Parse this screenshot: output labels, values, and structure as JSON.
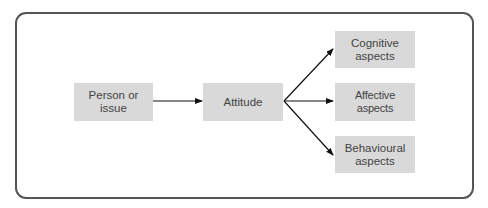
{
  "diagram": {
    "nodes": [
      {
        "id": "person",
        "label": "Person or issue"
      },
      {
        "id": "attitude",
        "label": "Attitude"
      },
      {
        "id": "cognitive",
        "label": "Cognitive aspects"
      },
      {
        "id": "affective",
        "label": "Affective aspects"
      },
      {
        "id": "behavioural",
        "label": "Behavioural aspects"
      }
    ],
    "edges": [
      {
        "from": "person",
        "to": "attitude"
      },
      {
        "from": "attitude",
        "to": "cognitive"
      },
      {
        "from": "attitude",
        "to": "affective"
      },
      {
        "from": "attitude",
        "to": "behavioural"
      }
    ],
    "colors": {
      "box_fill": "#d9d9d9",
      "frame": "#555555",
      "arrow": "#111111",
      "text": "#444444"
    }
  }
}
